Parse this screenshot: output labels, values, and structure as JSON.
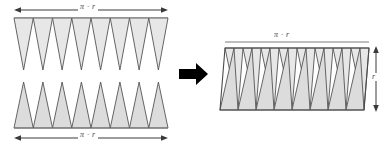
{
  "figure": {
    "colors": {
      "triangle_fill": "#e7e7e7",
      "triangle_fill_alt": "#dcdcdc",
      "outline": "#555555",
      "arrow": "#000000",
      "dimension_line": "#3a3a3a",
      "background": "#ffffff"
    },
    "left_panel": {
      "top_row": {
        "name": "downward-triangles-row",
        "orientation": "down",
        "count": 8,
        "dimension_label": "π · r"
      },
      "bottom_row": {
        "name": "upward-triangles-row",
        "orientation": "up",
        "count": 8,
        "dimension_label": "π · r"
      }
    },
    "transform_arrow": {
      "name": "transform-arrow",
      "direction": "right"
    },
    "right_panel": {
      "name": "parallelogram-assembly",
      "count": 8,
      "width_label": "π · r",
      "height_label": "r"
    }
  }
}
